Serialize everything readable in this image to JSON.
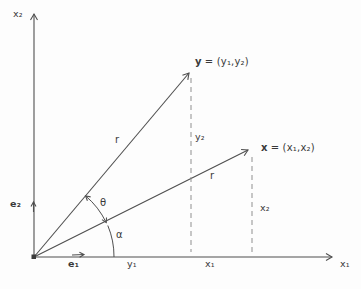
{
  "figure": {
    "colors": {
      "line": "#4f4f4f",
      "dash": "#8f8f8f",
      "text": "#3a3a3a",
      "background": "#fdfdfd"
    },
    "axes": {
      "x_axis_label": "x₁",
      "y_axis_label": "x₂"
    },
    "vectors": {
      "y": {
        "name": "y",
        "definition": "= (y₁,y₂)",
        "magnitude": "r"
      },
      "x": {
        "name": "x",
        "definition": "= (x₁,x₂)",
        "magnitude": "r"
      }
    },
    "angles": {
      "theta": "θ",
      "alpha": "α"
    },
    "basis": {
      "e1": "e₁",
      "e2": "e₂"
    },
    "coordinates": {
      "y1": "y₁",
      "y2": "y₂",
      "x1": "x₁",
      "x2": "x₂"
    }
  }
}
